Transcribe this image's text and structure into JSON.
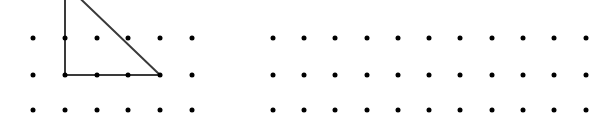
{
  "canvas": {
    "width": 615,
    "height": 118,
    "background_color": "#ffffff"
  },
  "figure": {
    "dot_color": "#000000",
    "dot_diameter": 5,
    "line_color": "#3a3a3a",
    "line_width": 2
  },
  "grids": [
    {
      "name": "left-grid",
      "columns": 6,
      "rows": 3,
      "origin_x": 33,
      "origin_y": 38,
      "spacing_x": 31.8,
      "spacing_y": 36
    },
    {
      "name": "right-grid",
      "columns": 11,
      "rows": 3,
      "origin_x": 273,
      "origin_y": 38,
      "spacing_x": 31.3,
      "spacing_y": 36
    }
  ],
  "shapes": [
    {
      "name": "right-triangle",
      "type": "polyline",
      "clipped_top": true,
      "points": [
        {
          "x": 65,
          "y": -16
        },
        {
          "x": 160,
          "y": 75
        },
        {
          "x": 65,
          "y": 75
        },
        {
          "x": 65,
          "y": -16
        }
      ]
    }
  ],
  "chart_data": {
    "type": "scatter",
    "title": "",
    "xlabel": "",
    "ylabel": "",
    "grid": false,
    "legend": null,
    "series": [
      {
        "name": "left-lattice-points",
        "marker": "filled-circle",
        "color": "#000000",
        "points": [
          [
            33,
            38
          ],
          [
            65,
            38
          ],
          [
            97,
            38
          ],
          [
            128,
            38
          ],
          [
            160,
            38
          ],
          [
            192,
            38
          ],
          [
            33,
            75
          ],
          [
            65,
            75
          ],
          [
            97,
            75
          ],
          [
            128,
            75
          ],
          [
            160,
            75
          ],
          [
            192,
            75
          ],
          [
            33,
            110
          ],
          [
            65,
            110
          ],
          [
            97,
            110
          ],
          [
            128,
            110
          ],
          [
            160,
            110
          ],
          [
            192,
            110
          ]
        ]
      },
      {
        "name": "right-lattice-points",
        "marker": "filled-circle",
        "color": "#000000",
        "points": [
          [
            273,
            38
          ],
          [
            304,
            38
          ],
          [
            335,
            38
          ],
          [
            367,
            38
          ],
          [
            398,
            38
          ],
          [
            429,
            38
          ],
          [
            460,
            38
          ],
          [
            492,
            38
          ],
          [
            523,
            38
          ],
          [
            554,
            38
          ],
          [
            586,
            38
          ],
          [
            273,
            75
          ],
          [
            304,
            75
          ],
          [
            335,
            75
          ],
          [
            367,
            75
          ],
          [
            398,
            75
          ],
          [
            429,
            75
          ],
          [
            460,
            75
          ],
          [
            492,
            75
          ],
          [
            523,
            75
          ],
          [
            554,
            75
          ],
          [
            586,
            75
          ],
          [
            273,
            110
          ],
          [
            304,
            110
          ],
          [
            335,
            110
          ],
          [
            367,
            110
          ],
          [
            398,
            110
          ],
          [
            429,
            110
          ],
          [
            460,
            110
          ],
          [
            492,
            110
          ],
          [
            523,
            110
          ],
          [
            554,
            110
          ],
          [
            586,
            110
          ]
        ]
      }
    ],
    "annotations": [
      {
        "name": "right-triangle-overlay",
        "type": "polygon",
        "stroke": "#3a3a3a",
        "fill": "none",
        "vertices": [
          [
            65,
            -16
          ],
          [
            160,
            75
          ],
          [
            65,
            75
          ]
        ]
      }
    ]
  }
}
